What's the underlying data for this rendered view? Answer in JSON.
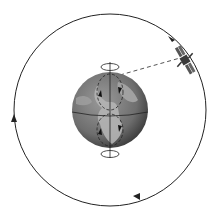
{
  "diagram": {
    "orbit": {
      "direction": "clockwise",
      "arrow_count": 3
    },
    "earth": {
      "rotation_markers": 2,
      "axis": "vertical",
      "equator_shown": true
    },
    "satellite": {
      "link_to_earth": "dashed-line"
    },
    "colors": {
      "background": "#ffffff",
      "line": "#222222",
      "earth_ocean": "#6e6e6e",
      "earth_land": "#b4b4b4",
      "satellite": "#3a3a3a"
    }
  }
}
